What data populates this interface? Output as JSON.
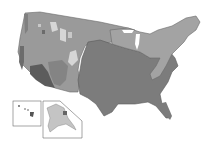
{
  "map": {
    "title": "",
    "regions": [
      {
        "name": "west-region",
        "color": "#9a9a9a"
      },
      {
        "name": "east-central-region",
        "color": "#7c7c7c"
      },
      {
        "name": "northeast-region",
        "color": "#a3a3a3"
      },
      {
        "name": "southwest-dark-region",
        "color": "#5c5c5c"
      },
      {
        "name": "mountain-light-patches",
        "color": "#d6d6d6"
      }
    ],
    "insets": [
      {
        "name": "hawaii-inset"
      },
      {
        "name": "alaska-inset"
      }
    ],
    "colors": {
      "background": "#ffffff",
      "border": "#6a6a6a"
    }
  }
}
